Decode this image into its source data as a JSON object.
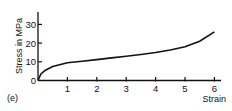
{
  "panel_label": "(e)",
  "chart_data": {
    "type": "line",
    "title": "",
    "xlabel": "Strain",
    "ylabel": "Stress in MPa",
    "xlim": [
      0,
      6.2
    ],
    "ylim": [
      0,
      36
    ],
    "x_ticks": [
      "1",
      "2",
      "3",
      "4",
      "5",
      "6"
    ],
    "y_ticks": [
      "0",
      "10",
      "20",
      "30"
    ],
    "grid": false,
    "legend": null,
    "series": [
      {
        "name": "stress-strain",
        "x": [
          0,
          0.1,
          0.25,
          0.5,
          1,
          1.5,
          2,
          2.5,
          3,
          3.5,
          4,
          4.5,
          5,
          5.5,
          6
        ],
        "y": [
          0,
          3.5,
          5.5,
          7.5,
          9.5,
          10.3,
          11.2,
          12.1,
          13.0,
          13.9,
          15.0,
          16.3,
          18.0,
          21.0,
          26.0
        ]
      }
    ]
  }
}
